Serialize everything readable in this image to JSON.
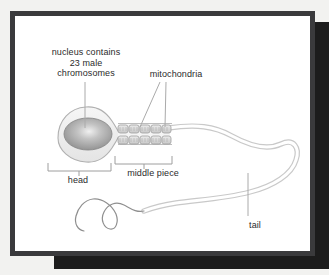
{
  "figure": {
    "background_color": "#ffffff",
    "page_color": "#f2f2f0",
    "frame_color": "#3a3a3c",
    "shadow_color": "#1c1c1c",
    "text_color": "#2b2b2b",
    "line_color": "#9a9a9a",
    "membrane_color": "#efefef",
    "nucleus_color": "#9d9d9d",
    "nucleus_highlight_color": "#e8e8e8",
    "mitochondria_color": "#dcdcdc"
  },
  "labels": {
    "nucleus": {
      "line1": "nucleus contains",
      "line2": "23 male",
      "line3": "chromosomes"
    },
    "mitochondria": "mitochondria",
    "head": "head",
    "middle_piece": "middle piece",
    "tail": "tail"
  },
  "structures": [
    {
      "name": "head",
      "description": "teardrop cell head containing nucleus"
    },
    {
      "name": "nucleus",
      "description": "gray ellipse with light highlight"
    },
    {
      "name": "middle-piece",
      "description": "two rows of mitochondria segments"
    },
    {
      "name": "tail",
      "description": "long looping flagellum"
    }
  ],
  "mitochondria_segments": {
    "rows": 2,
    "per_row": 5
  }
}
